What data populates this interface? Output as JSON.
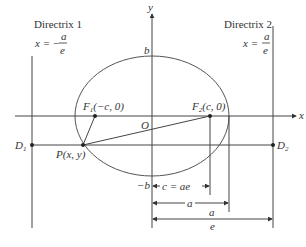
{
  "diagram": {
    "directrix1": {
      "title": "Directrix 1",
      "eq_lhs": "x = −",
      "eq_num": "a",
      "eq_den": "e"
    },
    "directrix2": {
      "title": "Directrix 2",
      "eq_lhs": "x =",
      "eq_num": "a",
      "eq_den": "e"
    },
    "axes": {
      "x_label": "x",
      "y_label": "y",
      "origin_label": "O"
    },
    "ellipse_labels": {
      "top": "b",
      "bottom": "−b"
    },
    "points": {
      "f1": {
        "name": "F",
        "sub": "1",
        "coords": "(−c, 0)"
      },
      "f2": {
        "name": "F",
        "sub": "2",
        "coords": "(c, 0)"
      },
      "p": "P(x, y)",
      "d1": {
        "name": "D",
        "sub": "1"
      },
      "d2": {
        "name": "D",
        "sub": "2"
      }
    },
    "dimensions": {
      "c": "c = ae",
      "a": "a",
      "a_over_e_num": "a",
      "a_over_e_den": "e"
    },
    "colors": {
      "line": "#444444",
      "text": "#333333",
      "background": "#ffffff"
    }
  }
}
